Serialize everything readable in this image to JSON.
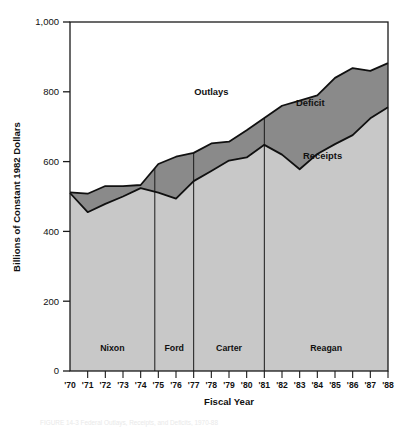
{
  "chart_data": {
    "type": "area",
    "title": "",
    "xlabel": "Fiscal Year",
    "ylabel": "Billions of Constant 1982 Dollars",
    "ylim": [
      0,
      1000
    ],
    "yticks": [
      0,
      200,
      400,
      600,
      800,
      1000
    ],
    "ytick_labels": [
      "0",
      "200",
      "400",
      "600",
      "800",
      "1,000"
    ],
    "grid": false,
    "legend_position": "inline-annotations",
    "categories": [
      "'70",
      "'71",
      "'72",
      "'73",
      "'74",
      "'75",
      "'76",
      "'77",
      "'78",
      "'79",
      "'80",
      "'81",
      "'82",
      "'83",
      "'84",
      "'85",
      "'86",
      "'87",
      "'88"
    ],
    "x_values": [
      1970,
      1971,
      1972,
      1973,
      1974,
      1975,
      1976,
      1977,
      1978,
      1979,
      1980,
      1981,
      1982,
      1983,
      1984,
      1985,
      1986,
      1987,
      1988
    ],
    "series": [
      {
        "name": "Outlays",
        "fill_color": "#8a8a8a",
        "values": [
          512,
          508,
          530,
          530,
          533,
          593,
          614,
          625,
          652,
          657,
          690,
          725,
          760,
          775,
          790,
          840,
          868,
          860,
          882
        ]
      },
      {
        "name": "Receipts",
        "fill_color": "#c8c8c8",
        "values": [
          510,
          455,
          479,
          500,
          524,
          511,
          494,
          544,
          573,
          603,
          612,
          648,
          620,
          578,
          622,
          650,
          676,
          724,
          756
        ]
      }
    ],
    "annotations": [
      {
        "name": "Outlays",
        "label": "Outlays",
        "x": 1978,
        "y": 790
      },
      {
        "name": "Deficit",
        "label": "Deficit",
        "x": 1983.6,
        "y": 760
      },
      {
        "name": "Receipts",
        "label": "Receipts",
        "x": 1984.3,
        "y": 608
      }
    ],
    "period_dividers": [
      1974.8,
      1977.0,
      1981.0
    ],
    "periods": [
      {
        "label": "Nixon",
        "start": 1970,
        "end": 1974.8,
        "y": 58
      },
      {
        "label": "Ford",
        "start": 1974.8,
        "end": 1977.0,
        "y": 58
      },
      {
        "label": "Carter",
        "start": 1977.0,
        "end": 1981.0,
        "y": 58
      },
      {
        "label": "Reagan",
        "start": 1981.0,
        "end": 1988,
        "y": 58
      }
    ]
  },
  "figure": {
    "caption": "FIGURE 14-3   Federal Outlays, Receipts, and Deficits, 1970-88"
  }
}
